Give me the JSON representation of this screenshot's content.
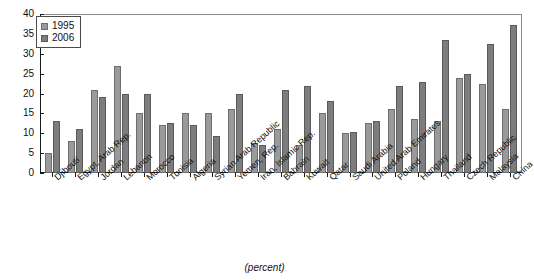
{
  "chart_data": {
    "type": "bar",
    "title": "",
    "subtitle": "",
    "caption": "(percent)",
    "xlabel": "",
    "ylabel": "",
    "ylim": [
      0,
      40
    ],
    "yticks": [
      0,
      5,
      10,
      15,
      20,
      25,
      30,
      35,
      40
    ],
    "grid": false,
    "legend_position": "top-left",
    "categories": [
      "Djibouti",
      "Egypt, Arab Rep.",
      "Jordan",
      "Lebanon",
      "Morocco",
      "Tunisia",
      "Algeria",
      "Syrian Arab Republic",
      "Yemen, Rep.",
      "Iran, Islamic Rep.",
      "Bahrain",
      "Kuwait",
      "Qatar",
      "Saudi Arabia",
      "United Arab Emirates",
      "Poland",
      "Hungary",
      "Thailand",
      "Czech Republic",
      "Malaysia",
      "China"
    ],
    "series": [
      {
        "name": "1995",
        "color": "#9a9a9a",
        "values": [
          5,
          8,
          20.8,
          27,
          15.2,
          12.2,
          15.2,
          15.2,
          16.2,
          7.5,
          11,
          7,
          15,
          10,
          12.5,
          16,
          13.5,
          13,
          24,
          22.5,
          16.2
        ]
      },
      {
        "name": "2006",
        "color": "#7d7d7d",
        "values": [
          13,
          11,
          19,
          20,
          20,
          12.6,
          12.1,
          9.2,
          20,
          7,
          21,
          22,
          18,
          10.2,
          13,
          22,
          23,
          33.5,
          25,
          32.5,
          37.2
        ]
      }
    ]
  },
  "legend": {
    "items": [
      {
        "label": "1995"
      },
      {
        "label": "2006"
      }
    ]
  }
}
